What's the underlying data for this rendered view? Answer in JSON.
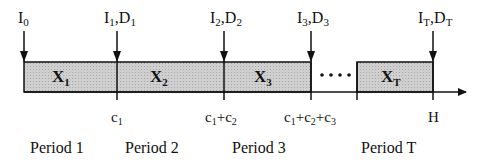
{
  "diagram": {
    "arrivals": [
      {
        "id": "I0",
        "base": "I",
        "sub": "0",
        "extra": null
      },
      {
        "id": "I1D1",
        "base": "I",
        "sub": "1",
        "extra": {
          "base": "D",
          "sub": "1"
        }
      },
      {
        "id": "I2D2",
        "base": "I",
        "sub": "2",
        "extra": {
          "base": "D",
          "sub": "2"
        }
      },
      {
        "id": "I3D3",
        "base": "I",
        "sub": "3",
        "extra": {
          "base": "D",
          "sub": "3"
        }
      },
      {
        "id": "ITDT",
        "base": "I",
        "sub": "T",
        "extra": {
          "base": "D",
          "sub": "T"
        }
      }
    ],
    "segments": [
      {
        "base": "X",
        "sub": "1"
      },
      {
        "base": "X",
        "sub": "2"
      },
      {
        "base": "X",
        "sub": "3"
      },
      {
        "base": "X",
        "sub": "T"
      }
    ],
    "ellipsis": "....",
    "ticks": [
      {
        "parts": [
          [
            "c",
            "1"
          ]
        ]
      },
      {
        "parts": [
          [
            "c",
            "1"
          ],
          [
            "+c",
            "2"
          ]
        ]
      },
      {
        "parts": [
          [
            "c",
            "1"
          ],
          [
            "+c",
            "2"
          ],
          [
            "+c",
            "3"
          ]
        ]
      },
      {
        "parts": [
          [
            "H",
            ""
          ]
        ]
      }
    ],
    "periods": [
      "Period 1",
      "Period 2",
      "Period 3",
      "Period T"
    ],
    "fill_color": "#c8c8c8",
    "line_color": "#111111"
  }
}
